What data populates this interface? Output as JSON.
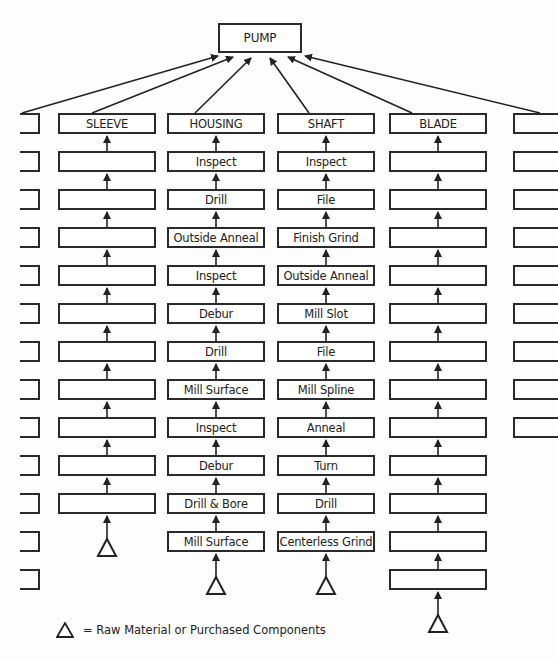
{
  "diagram": {
    "root": "PUMP",
    "legend": "= Raw Material or Purchased Components",
    "columns": [
      {
        "name": "SLEEVE",
        "steps": [
          "",
          "",
          "",
          "",
          "",
          "",
          "",
          "",
          "",
          ""
        ]
      },
      {
        "name": "HOUSING",
        "steps": [
          "Inspect",
          "Drill",
          "Outside Anneal",
          "Inspect",
          "Debur",
          "Drill",
          "Mill Surface",
          "Inspect",
          "Debur",
          "Drill & Bore",
          "Mill Surface"
        ]
      },
      {
        "name": "SHAFT",
        "steps": [
          "Inspect",
          "File",
          "Finish Grind",
          "Outside Anneal",
          "Mill Slot",
          "File",
          "Mill Spline",
          "Anneal",
          "Turn",
          "Drill",
          "Centerless Grind"
        ]
      },
      {
        "name": "BLADE",
        "steps": [
          "",
          "",
          "",
          "",
          "",
          "",
          "",
          "",
          "",
          "",
          "",
          ""
        ]
      }
    ]
  }
}
